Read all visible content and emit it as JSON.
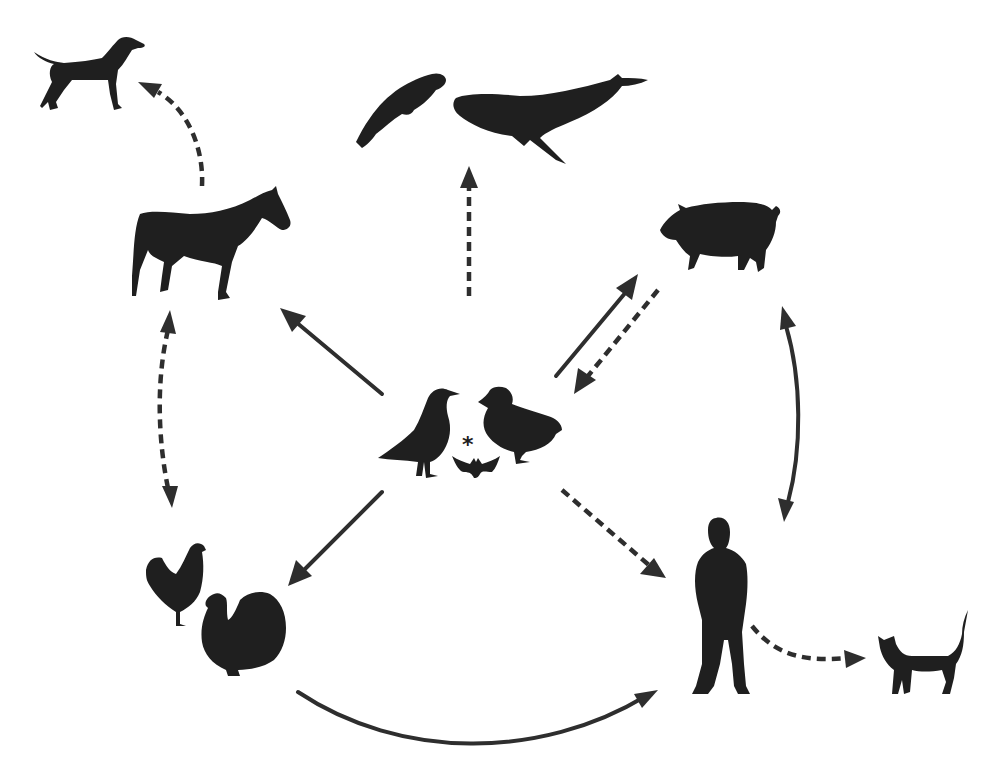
{
  "diagram": {
    "type": "transmission-network",
    "center_node": {
      "id": "wild-birds-bats",
      "members": [
        "gull",
        "duck",
        "bat"
      ],
      "annotation": "*"
    },
    "nodes": [
      {
        "id": "dog",
        "label": "dog"
      },
      {
        "id": "horse",
        "label": "horse"
      },
      {
        "id": "marine-mammals",
        "label": "seal and whale"
      },
      {
        "id": "pig",
        "label": "pig"
      },
      {
        "id": "poultry",
        "label": "chicken and turkey"
      },
      {
        "id": "human",
        "label": "human"
      },
      {
        "id": "cat",
        "label": "cat"
      },
      {
        "id": "wild-birds-bats",
        "label": "gull, duck and bat"
      }
    ],
    "edges": [
      {
        "from": "horse",
        "to": "dog",
        "style": "dashed",
        "direction": "forward"
      },
      {
        "from": "wild-birds-bats",
        "to": "marine-mammals",
        "style": "dashed",
        "direction": "forward"
      },
      {
        "from": "wild-birds-bats",
        "to": "horse",
        "style": "solid",
        "direction": "forward"
      },
      {
        "from": "wild-birds-bats",
        "to": "pig",
        "style": "solid",
        "direction": "forward"
      },
      {
        "from": "pig",
        "to": "wild-birds-bats",
        "style": "dashed",
        "direction": "forward"
      },
      {
        "from": "horse",
        "to": "poultry",
        "style": "dashed",
        "direction": "bidirectional"
      },
      {
        "from": "pig",
        "to": "human",
        "style": "solid",
        "direction": "bidirectional"
      },
      {
        "from": "wild-birds-bats",
        "to": "poultry",
        "style": "solid",
        "direction": "forward"
      },
      {
        "from": "wild-birds-bats",
        "to": "human",
        "style": "dashed",
        "direction": "forward"
      },
      {
        "from": "poultry",
        "to": "human",
        "style": "solid",
        "direction": "forward"
      },
      {
        "from": "human",
        "to": "cat",
        "style": "dashed",
        "direction": "forward"
      }
    ],
    "colors": {
      "background": "#ffffff",
      "silhouette": "#1f1f1f",
      "arrow": "#2e2e2e"
    }
  }
}
